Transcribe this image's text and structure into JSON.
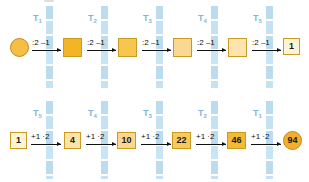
{
  "diagram": {
    "colors": {
      "strip": "#bcdcee",
      "tlabel": "#7fb6d9",
      "box_border": "#c99b22",
      "circle_border": "#c6881a",
      "arrow": "#111111",
      "gold_dark": "#f3b526",
      "gold_mid": "#f8c74a",
      "gold_light": "#fbdc8e",
      "cream": "#fdf4d8",
      "orange_circle": "#f2ae2e"
    },
    "rows": [
      {
        "id": "row-top",
        "direction": "left-to-right",
        "operation_label": ":2 –1",
        "t_labels": [
          {
            "label": "T",
            "sub": "1"
          },
          {
            "label": "T",
            "sub": "2"
          },
          {
            "label": "T",
            "sub": "3"
          },
          {
            "label": "T",
            "sub": "4"
          },
          {
            "label": "T",
            "sub": "5"
          }
        ],
        "nodes": [
          {
            "shape": "circle",
            "value": "",
            "fill": "#f5bf46"
          },
          {
            "shape": "square",
            "value": "",
            "fill": "#f3b526"
          },
          {
            "shape": "square",
            "value": "",
            "fill": "#f7c64f"
          },
          {
            "shape": "square",
            "value": "",
            "fill": "#fad793"
          },
          {
            "shape": "square",
            "value": "",
            "fill": "#fce4ae"
          },
          {
            "shape": "square",
            "value": "1",
            "fill": "#fdf4d8"
          }
        ],
        "operations": [
          ":2 –1",
          ":2 –1",
          ":2 –1",
          ":2 –1",
          ":2 –1"
        ]
      },
      {
        "id": "row-bottom",
        "direction": "left-to-right",
        "operation_label": "+1 ·2",
        "t_labels": [
          {
            "label": "T",
            "sub": "5"
          },
          {
            "label": "T",
            "sub": "4"
          },
          {
            "label": "T",
            "sub": "3"
          },
          {
            "label": "T",
            "sub": "2"
          },
          {
            "label": "T",
            "sub": "1"
          }
        ],
        "nodes": [
          {
            "shape": "square",
            "value": "1",
            "fill": "#fdf4d8"
          },
          {
            "shape": "square",
            "value": "4",
            "fill": "#fce3ab"
          },
          {
            "shape": "square",
            "value": "10",
            "fill": "#fad68f"
          },
          {
            "shape": "square",
            "value": "22",
            "fill": "#f8c95c"
          },
          {
            "shape": "square",
            "value": "46",
            "fill": "#f4bb32"
          },
          {
            "shape": "circle",
            "value": "94",
            "fill": "#f2ae2e"
          }
        ],
        "operations": [
          "+1 ·2",
          "+1 ·2",
          "+1 ·2",
          "+1 ·2",
          "+1 ·2"
        ]
      }
    ]
  }
}
